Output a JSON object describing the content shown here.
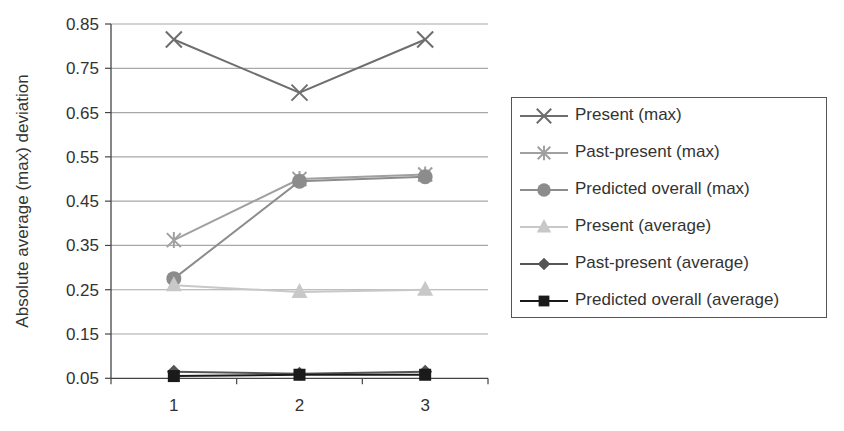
{
  "chart_data": {
    "type": "line",
    "title": "",
    "xlabel": "",
    "ylabel": "Absolute average (max) deviation",
    "categories": [
      "1",
      "2",
      "3"
    ],
    "ylim": [
      0.05,
      0.85
    ],
    "yticks": [
      "0.85",
      "0.75",
      "0.65",
      "0.55",
      "0.45",
      "0.35",
      "0.25",
      "0.15",
      "0.05"
    ],
    "grid": true,
    "legend_position": "right",
    "series": [
      {
        "name": "Present (max)",
        "marker": "x",
        "color": "#6e6e6e",
        "values": [
          0.815,
          0.695,
          0.815
        ]
      },
      {
        "name": "Past-present (max)",
        "marker": "asterisk",
        "color": "#a0a0a0",
        "values": [
          0.362,
          0.5,
          0.51
        ]
      },
      {
        "name": "Predicted overall (max)",
        "marker": "circle",
        "color": "#8c8c8c",
        "values": [
          0.275,
          0.495,
          0.505
        ]
      },
      {
        "name": "Present (average)",
        "marker": "triangle",
        "color": "#c8c8c8",
        "values": [
          0.26,
          0.245,
          0.25
        ]
      },
      {
        "name": "Past-present (average)",
        "marker": "diamond",
        "color": "#555555",
        "values": [
          0.065,
          0.06,
          0.065
        ]
      },
      {
        "name": "Predicted overall (average)",
        "marker": "square",
        "color": "#1a1a1a",
        "values": [
          0.055,
          0.058,
          0.058
        ]
      }
    ]
  },
  "legend": {
    "items": [
      "Present (max)",
      "Past-present (max)",
      "Predicted overall (max)",
      "Present (average)",
      "Past-present (average)",
      "Predicted overall (average)"
    ]
  }
}
